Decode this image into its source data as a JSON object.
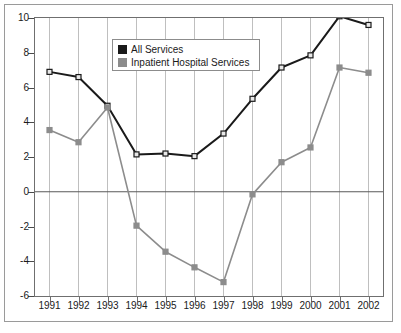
{
  "chart_data": {
    "type": "line",
    "title": "",
    "xlabel": "",
    "ylabel": "",
    "categories": [
      "1991",
      "1992",
      "1993",
      "1994",
      "1995",
      "1996",
      "1997",
      "1998",
      "1999",
      "2000",
      "2001",
      "2002"
    ],
    "x": [
      1991,
      1992,
      1993,
      1994,
      1995,
      1996,
      1997,
      1998,
      1999,
      2000,
      2001,
      2002
    ],
    "ylim": [
      -6,
      10
    ],
    "yticks": [
      10,
      8,
      6,
      4,
      2,
      0,
      -2,
      -4,
      -6
    ],
    "ytick_labels": [
      "10",
      "8",
      "6",
      "4",
      "2",
      "0",
      "-2",
      "-4",
      "-6"
    ],
    "grid": "vertical",
    "legend_position": "upper-center-left",
    "zero_line": 0,
    "series": [
      {
        "name": "All Services",
        "color": "#1a1a1a",
        "marker": "square",
        "values": [
          6.9,
          6.6,
          4.95,
          2.15,
          2.2,
          2.05,
          3.35,
          5.35,
          7.15,
          7.85,
          10.1,
          9.6
        ]
      },
      {
        "name": "Inpatient Hospital Services",
        "color": "#8c8c8c",
        "marker": "square",
        "values": [
          3.55,
          2.85,
          4.85,
          -1.95,
          -3.45,
          -4.35,
          -5.2,
          -0.15,
          1.7,
          2.55,
          7.15,
          6.85
        ]
      }
    ]
  },
  "legend": {
    "items": [
      {
        "label": "All Services",
        "color": "#1a1a1a"
      },
      {
        "label": "Inpatient Hospital Services",
        "color": "#8c8c8c"
      }
    ]
  },
  "colors": {
    "all_services": "#1a1a1a",
    "inpatient_hospital_services": "#8c8c8c",
    "gridline": "#bfbfbf",
    "axis": "#6f6f6f",
    "frame": "#9a9a9a",
    "background": "#ffffff"
  }
}
